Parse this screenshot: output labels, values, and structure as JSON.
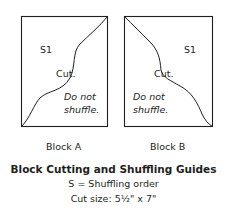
{
  "blocks": [
    {
      "name": "Block A",
      "order_label": "S1",
      "cut_label": "Cut.",
      "note_line1": "Do not",
      "note_line2": "shuffle."
    },
    {
      "name": "Block B",
      "order_label": "S1",
      "cut_label": "Cut.",
      "note_line1": "Do not",
      "note_line2": "shuffle."
    }
  ],
  "caption": {
    "title": "Block Cutting and Shuffling Guides",
    "legend": "S = Shuffling order",
    "cut_size": "Cut size: 5½\" x 7\""
  },
  "colors": {
    "line": "#231f20",
    "background": "#ffffff"
  }
}
